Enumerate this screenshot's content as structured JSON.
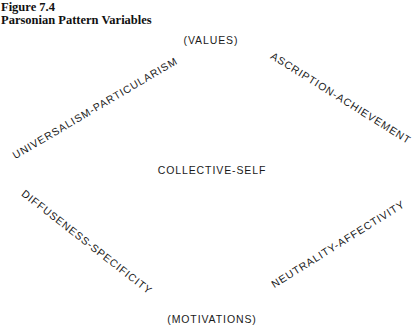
{
  "figure": {
    "number": "Figure 7.4",
    "title": "Parsonian Pattern Variables"
  },
  "diagram": {
    "top_label": "(VALUES)",
    "bottom_label": "(MOTIVATIONS)",
    "center_label": "COLLECTIVE-SELF",
    "edges": {
      "upper_left": "UNIVERSALISM-PARTICULARISM",
      "upper_right": "ASCRIPTION-ACHIEVEMENT",
      "lower_left": "DIFFUSENESS-SPECIFICITY",
      "lower_right": "NEUTRALITY-AFFECTIVITY"
    }
  }
}
